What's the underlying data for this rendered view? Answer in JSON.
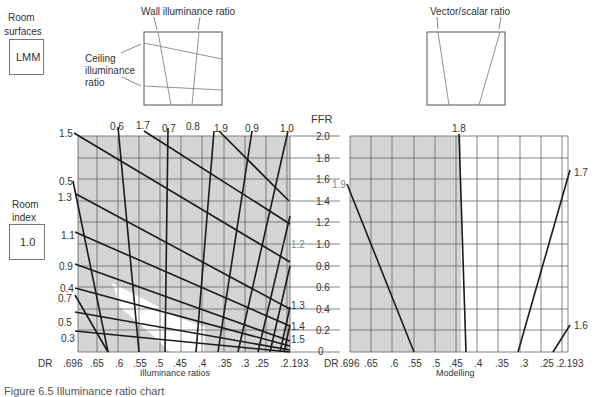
{
  "room_surfaces": {
    "label_line1": "Room",
    "label_line2": "surfaces",
    "value": "LMM"
  },
  "room_index": {
    "label_line1": "Room",
    "label_line2": "index",
    "value": "1.0"
  },
  "inset_left": {
    "title": "Wall illuminance ratio",
    "side_label_line1": "Ceiling",
    "side_label_line2": "illuminance",
    "side_label_line3": "ratio"
  },
  "inset_right": {
    "title": "Vector/scalar ratio"
  },
  "ffr_axis": {
    "title": "FFR",
    "ticks": [
      "2.0",
      "1.8",
      "1.6",
      "1.4",
      "1.2",
      "1.0",
      "0.8",
      "0.6",
      "0.4",
      "0.2",
      "0"
    ]
  },
  "left_chart": {
    "xlabel": "Illuminance ratios",
    "dr_label": "DR",
    "x_ticks": [
      ".696",
      ".65",
      ".6",
      ".55",
      ".5",
      ".45",
      ".4",
      ".35",
      ".3",
      ".25",
      ".2",
      ".193"
    ],
    "top_labels": [
      "0.6",
      "1.7",
      "0.7",
      "0.8",
      "1.9",
      "0.9",
      "1.0"
    ],
    "left_labels": [
      "1.5",
      "0.5",
      "1.3",
      "1.1",
      "0.9",
      "0.4",
      "0.7",
      "0.5",
      "0.3"
    ],
    "right_labels": [
      "1.2",
      "1.3",
      "1.4",
      "1.5"
    ]
  },
  "right_chart": {
    "xlabel": "Modelling",
    "dr_label": "DR",
    "x_ticks": [
      ".696",
      ".65",
      ".6",
      ".55",
      ".5",
      ".45",
      ".4",
      ".35",
      ".3",
      ".25",
      ".2",
      ".193"
    ],
    "curve_labels": [
      "1.9",
      "1.8",
      "1.7",
      "1.6"
    ]
  },
  "colors": {
    "shade": "#d4d4d4",
    "grid": "#666666",
    "line": "#1a1a1a"
  },
  "caption": "Figure 6.5  Illuminance ratio chart"
}
